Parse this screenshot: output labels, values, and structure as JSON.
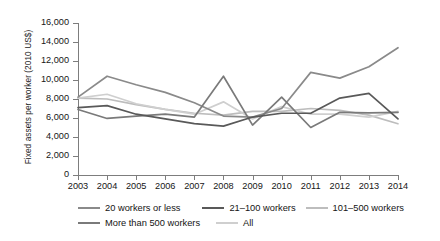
{
  "chart_data": {
    "type": "line",
    "title": "",
    "xlabel": "",
    "ylabel": "Fixed assets per worker (2010 US$)",
    "x": [
      2003,
      2004,
      2005,
      2006,
      2007,
      2008,
      2009,
      2010,
      2011,
      2012,
      2013,
      2014
    ],
    "categories": [
      "2003",
      "2004",
      "2005",
      "2006",
      "2007",
      "2008",
      "2009",
      "2010",
      "2011",
      "2012",
      "2013",
      "2014"
    ],
    "ylim": [
      0,
      16000
    ],
    "ytick_values": [
      0,
      2000,
      4000,
      6000,
      8000,
      10000,
      12000,
      14000,
      16000
    ],
    "ytick_labels": [
      "0",
      "2,000",
      "4,000",
      "6,000",
      "8,000",
      "10,000",
      "12,000",
      "14,000",
      "16,000"
    ],
    "grid": false,
    "legend_position": "bottom",
    "series": [
      {
        "name": "20 workers or less",
        "color": "#8a8a8a",
        "values": [
          8200,
          10400,
          9500,
          8700,
          7600,
          6200,
          6100,
          7000,
          10800,
          10200,
          11400,
          13400
        ]
      },
      {
        "name": "21–100 workers",
        "color": "#595959",
        "values": [
          7100,
          7300,
          6400,
          5900,
          5400,
          5150,
          6100,
          6500,
          6500,
          8100,
          8600,
          5900
        ]
      },
      {
        "name": "101–500 workers",
        "color": "#bdbdbd",
        "values": [
          8100,
          8000,
          7400,
          6900,
          6500,
          6300,
          6700,
          6700,
          7000,
          6800,
          6300,
          5400
        ]
      },
      {
        "name": "More than 500 workers",
        "color": "#7a7a7a",
        "values": [
          6900,
          5950,
          6200,
          6400,
          6100,
          10400,
          5250,
          8200,
          5000,
          6600,
          6550,
          6600
        ]
      },
      {
        "name": "All",
        "color": "#cfcfcf",
        "values": [
          8100,
          8500,
          7500,
          6900,
          6400,
          7700,
          5900,
          7200,
          6400,
          6400,
          6100,
          6700
        ]
      }
    ]
  },
  "legend": {
    "row1": [
      "20 workers or less",
      "21–100 workers",
      "101–500 workers"
    ],
    "row2": [
      "More than 500 workers",
      "All"
    ]
  }
}
